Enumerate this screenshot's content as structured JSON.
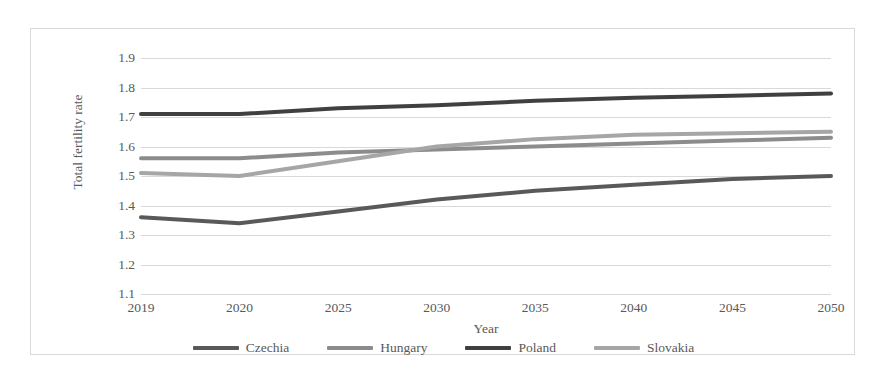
{
  "chart_data": {
    "type": "line",
    "title": "",
    "xlabel": "Year",
    "ylabel": "Total fertility rate",
    "categories": [
      "2019",
      "2020",
      "2025",
      "2030",
      "2035",
      "2040",
      "2045",
      "2050"
    ],
    "ylim": [
      1.1,
      1.9
    ],
    "y_ticks": [
      "1.9",
      "1.8",
      "1.7",
      "1.6",
      "1.5",
      "1.4",
      "1.3",
      "1.2",
      "1.1"
    ],
    "grid": true,
    "legend_position": "bottom",
    "series": [
      {
        "name": "Czechia",
        "color": "#595959",
        "values": [
          1.36,
          1.34,
          1.38,
          1.42,
          1.45,
          1.47,
          1.49,
          1.5
        ]
      },
      {
        "name": "Hungary",
        "color": "#8c8c8c",
        "values": [
          1.56,
          1.56,
          1.58,
          1.59,
          1.6,
          1.61,
          1.62,
          1.63
        ]
      },
      {
        "name": "Poland",
        "color": "#404040",
        "values": [
          1.71,
          1.71,
          1.73,
          1.74,
          1.755,
          1.765,
          1.772,
          1.78
        ]
      },
      {
        "name": "Slovakia",
        "color": "#a6a6a6",
        "values": [
          1.51,
          1.5,
          1.55,
          1.6,
          1.625,
          1.64,
          1.645,
          1.65
        ]
      }
    ]
  },
  "legend": {
    "items": [
      {
        "label": "Czechia"
      },
      {
        "label": "Hungary"
      },
      {
        "label": "Poland"
      },
      {
        "label": "Slovakia"
      }
    ]
  },
  "colors": {
    "gridline": "#d9d9d9",
    "border": "#d9d9d9",
    "text": "#595959",
    "background": "#ffffff"
  }
}
